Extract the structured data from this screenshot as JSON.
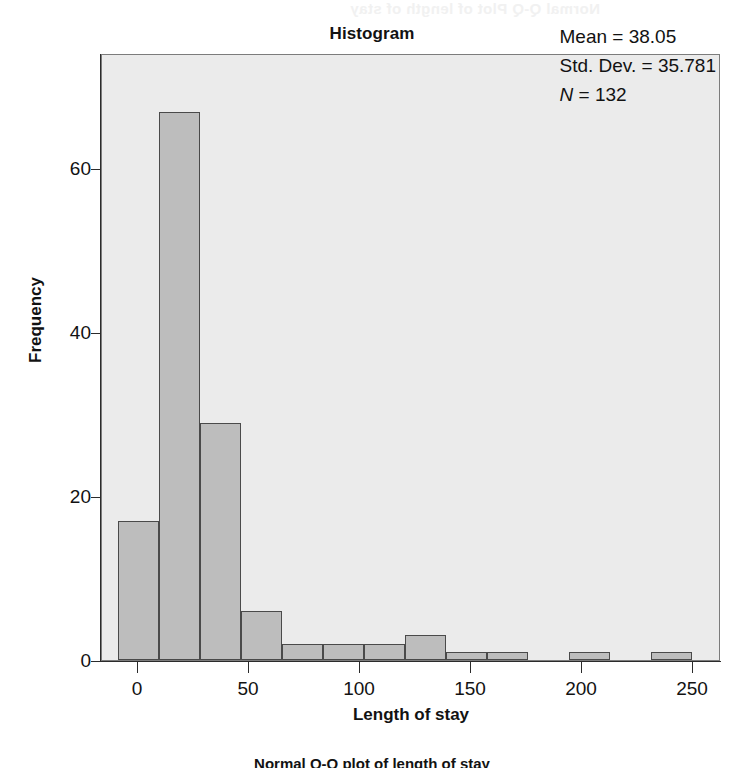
{
  "page": {
    "bleed_through_text": "Normal Q-Q Plot of length of stay",
    "bottom_caption": "Normal Q-Q plot of length of stay"
  },
  "chart_data": {
    "type": "bar",
    "title": "Histogram",
    "subtitle": "",
    "xlabel": "Length of stay",
    "ylabel": "Frequency",
    "xlim": [
      -11,
      267
    ],
    "ylim": [
      0,
      74
    ],
    "xticks": [
      0,
      50,
      100,
      150,
      200,
      250
    ],
    "yticks": [
      0,
      20,
      40,
      60
    ],
    "xtick_labels": [
      "0",
      "50",
      "100",
      "150",
      "200",
      "250"
    ],
    "ytick_labels": [
      "0",
      "20",
      "40",
      "60"
    ],
    "grid": false,
    "legend": "none",
    "bin_width": 18.5,
    "bins": [
      {
        "x0": -4.0,
        "x1": 14.5,
        "value": 17
      },
      {
        "x0": 14.5,
        "x1": 33.0,
        "value": 67
      },
      {
        "x0": 33.0,
        "x1": 51.5,
        "value": 29
      },
      {
        "x0": 51.5,
        "x1": 70.0,
        "value": 6
      },
      {
        "x0": 70.0,
        "x1": 88.5,
        "value": 2
      },
      {
        "x0": 88.5,
        "x1": 107.0,
        "value": 2
      },
      {
        "x0": 107.0,
        "x1": 125.5,
        "value": 2
      },
      {
        "x0": 125.5,
        "x1": 144.0,
        "value": 3
      },
      {
        "x0": 144.0,
        "x1": 162.5,
        "value": 1
      },
      {
        "x0": 162.5,
        "x1": 181.0,
        "value": 1
      },
      {
        "x0": 181.0,
        "x1": 199.5,
        "value": 0
      },
      {
        "x0": 199.5,
        "x1": 218.0,
        "value": 1
      },
      {
        "x0": 218.0,
        "x1": 236.5,
        "value": 0
      },
      {
        "x0": 236.5,
        "x1": 255.0,
        "value": 1
      }
    ],
    "categories": [
      "-4 to 14.5",
      "14.5 to 33",
      "33 to 51.5",
      "51.5 to 70",
      "70 to 88.5",
      "88.5 to 107",
      "107 to 125.5",
      "125.5 to 144",
      "144 to 162.5",
      "162.5 to 181",
      "181 to 199.5",
      "199.5 to 218",
      "218 to 236.5",
      "236.5 to 255"
    ],
    "values": [
      17,
      67,
      29,
      6,
      2,
      2,
      2,
      3,
      1,
      1,
      0,
      1,
      0,
      1
    ],
    "annotations": {
      "mean_label": "Mean = 38.05",
      "std_dev_label": "Std. Dev. = 35.781",
      "n_symbol": "N",
      "n_value_label": " = 132",
      "mean": 38.05,
      "std_dev": 35.781,
      "n": 132
    },
    "colors": {
      "bar_fill": "#bdbdbd",
      "bar_stroke": "#4a4a4a",
      "plot_background": "#ebebeb",
      "axis": "#2b2b2b",
      "text": "#121212"
    }
  }
}
